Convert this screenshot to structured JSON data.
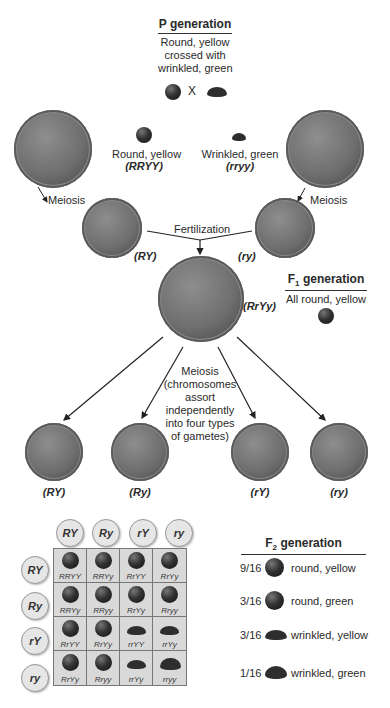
{
  "p_generation": {
    "heading": "P generation",
    "desc_line1": "Round, yellow",
    "desc_line2": "crossed with",
    "desc_line3": "wrinkled, green",
    "cross_symbol": "X"
  },
  "parents": {
    "left": {
      "phenotype": "Round, yellow",
      "genotype": "(RRYY)",
      "process": "Meiosis",
      "gamete": "(RY)"
    },
    "right": {
      "phenotype": "Wrinkled, green",
      "genotype": "(rryy)",
      "process": "Meiosis",
      "gamete": "(ry)"
    }
  },
  "fertilization": {
    "label": "Fertilization",
    "zygote_genotype": "(RrYy)"
  },
  "f1_generation": {
    "heading": "F1 generation",
    "heading_main": "F",
    "heading_sub": "1",
    "heading_rest": " generation",
    "desc": "All round, yellow"
  },
  "meiosis2": {
    "line1": "Meiosis",
    "line2": "(chromosomes",
    "line3": "assort",
    "line4": "independently",
    "line5": "into four types",
    "line6": "of gametes)"
  },
  "gametes": [
    "(RY)",
    "(Ry)",
    "(rY)",
    "(ry)"
  ],
  "punnett": {
    "col_headers": [
      "RY",
      "Ry",
      "rY",
      "ry"
    ],
    "row_headers": [
      "RY",
      "Ry",
      "rY",
      "ry"
    ],
    "cells": [
      [
        "RRYY",
        "RRYy",
        "RrYY",
        "RrYy"
      ],
      [
        "RRYy",
        "RRyy",
        "RrYy",
        "Rryy"
      ],
      [
        "RrYY",
        "RrYy",
        "rrYY",
        "rrYy"
      ],
      [
        "RrYy",
        "Rryy",
        "rrYy",
        "rryy"
      ]
    ],
    "shapes": [
      [
        "round",
        "round",
        "round",
        "round"
      ],
      [
        "round",
        "round",
        "round",
        "round"
      ],
      [
        "round",
        "round",
        "wrinkled",
        "wrinkled"
      ],
      [
        "round",
        "round",
        "wrinkled",
        "wrinkled"
      ]
    ]
  },
  "f2_generation": {
    "heading_main": "F",
    "heading_sub": "2",
    "heading_rest": " generation",
    "ratios": [
      {
        "fraction": "9/16",
        "phenotype": "round, yellow",
        "shape": "round"
      },
      {
        "fraction": "3/16",
        "phenotype": "round, green",
        "shape": "round"
      },
      {
        "fraction": "3/16",
        "phenotype": "wrinkled, yellow",
        "shape": "wrinkled"
      },
      {
        "fraction": "1/16",
        "phenotype": "wrinkled, green",
        "shape": "wrinkled"
      }
    ]
  }
}
